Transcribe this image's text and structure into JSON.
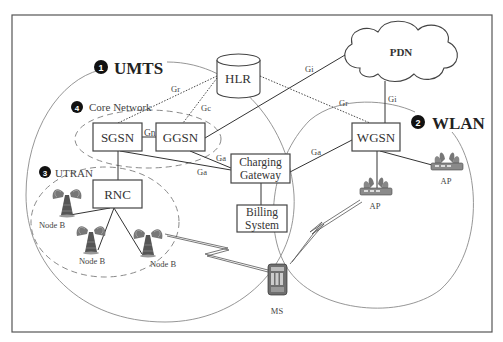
{
  "diagram": {
    "regions": {
      "umts": {
        "badge": "1",
        "label": "UMTS"
      },
      "wlan": {
        "badge": "2",
        "label": "WLAN"
      },
      "utran": {
        "badge": "3",
        "label": "UTRAN"
      },
      "core_network": {
        "badge": "4",
        "label": "Core Network"
      }
    },
    "nodes": {
      "hlr": "HLR",
      "pdn": "PDN",
      "sgsn": "SGSN",
      "ggsn": "GGSN",
      "wgsn": "WGSN",
      "rnc": "RNC",
      "charging_gateway": {
        "line1": "Charging",
        "line2": "Gateway"
      },
      "billing_system": {
        "line1": "Billing",
        "line2": "System"
      },
      "ms": "MS",
      "node_b": [
        "Node B",
        "Node B",
        "Node B"
      ],
      "ap": [
        "AP",
        "AP"
      ]
    },
    "interfaces": {
      "sgsn_hlr": "Gr",
      "ggsn_hlr": "Gc",
      "sgsn_ggsn": "Gn",
      "ggsn_pdn": "Gi",
      "wgsn_pdn": "Gi",
      "hlr_wgsn": "Gr",
      "ggsn_cg": "Ga",
      "sgsn_cg": "Ga",
      "wgsn_cg": "Ga"
    },
    "colors": {
      "line": "#333333",
      "circle": "#8a8a8a",
      "dashed": "#8a8a8a",
      "frame": "#555555"
    }
  }
}
